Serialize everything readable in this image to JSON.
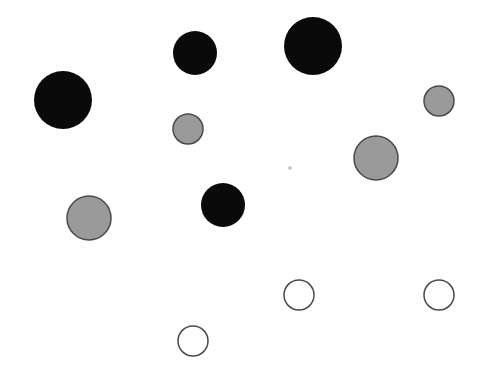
{
  "figure": {
    "width": 485,
    "height": 367,
    "background": "#ffffff"
  },
  "colors": {
    "black": "#0a0a0a",
    "gray": "#9a9a9a",
    "white": "#ffffff",
    "stroke": "#4a4a4a",
    "dot": "#c8c8c8"
  },
  "circles": [
    {
      "id": "black-large-left",
      "cx": 63,
      "cy": 100,
      "r": 29,
      "fill": "black"
    },
    {
      "id": "black-medium-top",
      "cx": 195,
      "cy": 53,
      "r": 22,
      "fill": "black"
    },
    {
      "id": "black-large-top",
      "cx": 313,
      "cy": 46,
      "r": 29,
      "fill": "black"
    },
    {
      "id": "gray-small-center-left",
      "cx": 188,
      "cy": 129,
      "r": 15,
      "fill": "gray"
    },
    {
      "id": "gray-small-right",
      "cx": 439,
      "cy": 101,
      "r": 15,
      "fill": "gray"
    },
    {
      "id": "gray-medium-right",
      "cx": 376,
      "cy": 158,
      "r": 22,
      "fill": "gray"
    },
    {
      "id": "gray-medium-left",
      "cx": 89,
      "cy": 218,
      "r": 22,
      "fill": "gray"
    },
    {
      "id": "black-medium-center",
      "cx": 223,
      "cy": 205,
      "r": 22,
      "fill": "black"
    },
    {
      "id": "white-small-center",
      "cx": 299,
      "cy": 295,
      "r": 15,
      "fill": "white"
    },
    {
      "id": "white-small-right",
      "cx": 439,
      "cy": 295,
      "r": 15,
      "fill": "white"
    },
    {
      "id": "white-small-bottom",
      "cx": 193,
      "cy": 341,
      "r": 15,
      "fill": "white"
    }
  ],
  "dots": [
    {
      "id": "center-dot",
      "cx": 290,
      "cy": 168,
      "r": 2
    }
  ]
}
